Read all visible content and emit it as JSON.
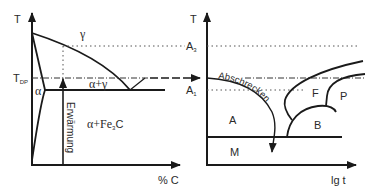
{
  "left_diagram": {
    "y_axis_label": "T",
    "x_axis_label": "% C",
    "tdp_label": "T",
    "tdp_subscript": "DP",
    "phase_gamma": "γ",
    "phase_alpha": "α",
    "phase_alpha_gamma": "α+γ",
    "phase_alpha_fe3c_prefix": "α+Fe",
    "phase_alpha_fe3c_sub": "3",
    "phase_alpha_fe3c_suffix": "C",
    "heating_label": "Erwärmung"
  },
  "right_diagram": {
    "y_axis_label": "T",
    "x_axis_label": "lg t",
    "a3_label": "A",
    "a3_subscript": "3",
    "a1_label": "A",
    "a1_subscript": "1",
    "quench_label": "Abschrecken",
    "region_austenite": "A",
    "region_martensite": "M",
    "region_bainite": "B",
    "region_ferrite": "F",
    "region_pearlite": "P"
  },
  "colors": {
    "line": "#1a1a1a",
    "text": "#2a2a2a",
    "dotted": "#555555"
  }
}
